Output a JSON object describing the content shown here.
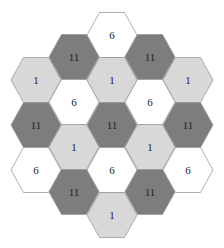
{
  "colors": {
    "dark": "#7d7d7d",
    "light": "#d8d8d8",
    "white": "#ffffff",
    "stroke": "#9a9a9a"
  },
  "hexes": [
    {
      "x": 112,
      "y": 35,
      "label": "6",
      "shade": "white"
    },
    {
      "x": 74,
      "y": 57,
      "label": "11",
      "shade": "dark"
    },
    {
      "x": 150,
      "y": 57,
      "label": "11",
      "shade": "dark"
    },
    {
      "x": 36,
      "y": 80,
      "label": "1",
      "shade": "light"
    },
    {
      "x": 112,
      "y": 80,
      "label": "1",
      "shade": "light"
    },
    {
      "x": 188,
      "y": 80,
      "label": "1",
      "shade": "light"
    },
    {
      "x": 74,
      "y": 102,
      "label": "6",
      "shade": "white"
    },
    {
      "x": 150,
      "y": 102,
      "label": "6",
      "shade": "white"
    },
    {
      "x": 36,
      "y": 125,
      "label": "11",
      "shade": "dark"
    },
    {
      "x": 112,
      "y": 125,
      "label": "11",
      "shade": "dark"
    },
    {
      "x": 188,
      "y": 125,
      "label": "11",
      "shade": "dark"
    },
    {
      "x": 74,
      "y": 147,
      "label": "1",
      "shade": "light"
    },
    {
      "x": 150,
      "y": 147,
      "label": "1",
      "shade": "light"
    },
    {
      "x": 36,
      "y": 170,
      "label": "6",
      "shade": "white"
    },
    {
      "x": 112,
      "y": 170,
      "label": "6",
      "shade": "white"
    },
    {
      "x": 188,
      "y": 170,
      "label": "6",
      "shade": "white"
    },
    {
      "x": 74,
      "y": 192,
      "label": "11",
      "shade": "dark"
    },
    {
      "x": 150,
      "y": 192,
      "label": "11",
      "shade": "dark"
    },
    {
      "x": 112,
      "y": 215,
      "label": "1",
      "shade": "light"
    }
  ]
}
